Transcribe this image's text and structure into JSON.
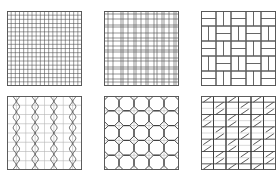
{
  "figure": {
    "title": "",
    "background_color": "#ffffff",
    "line_color": "#3a3a3a",
    "light_line_color": "#b4b4b4",
    "border_color": "#555555",
    "panel_count": 6,
    "layout": "2 rows x 3 columns"
  },
  "panels": [
    {
      "id": "panel-1",
      "name": "uniform-fine-grid",
      "label": "",
      "pattern_type": "square-grid",
      "row": 1,
      "col": 1,
      "x": 7,
      "y": 11,
      "w": 75,
      "h": 75,
      "columns": 18,
      "rows": 18,
      "regular": true,
      "has_diagonals": false,
      "line_color": "#4a4a4a"
    },
    {
      "id": "panel-2",
      "name": "irregular-grid",
      "label": "",
      "pattern_type": "irregular-grid",
      "row": 1,
      "col": 2,
      "x": 104,
      "y": 11,
      "w": 75,
      "h": 75,
      "x_positions": [
        0,
        4,
        9,
        17,
        19,
        24,
        30,
        32,
        37,
        42,
        44,
        50,
        53,
        58,
        60,
        65,
        70,
        72,
        75
      ],
      "y_positions": [
        0,
        3,
        8,
        14,
        16,
        22,
        27,
        30,
        35,
        39,
        41,
        47,
        50,
        56,
        58,
        63,
        68,
        71,
        75
      ],
      "regular": false,
      "has_diagonals": false,
      "line_color": "#4a4a4a"
    },
    {
      "id": "panel-3",
      "name": "basketweave-brick",
      "label": "",
      "pattern_type": "basketweave",
      "row": 1,
      "col": 3,
      "x": 201,
      "y": 11,
      "w": 75,
      "h": 75,
      "unit_cells": 5,
      "bricks_per_unit": 2,
      "regular": true,
      "has_diagonals": false,
      "line_color": "#4a4a4a"
    },
    {
      "id": "panel-4",
      "name": "wavy-vertical-lines",
      "label": "",
      "pattern_type": "sinusoidal-columns",
      "row": 2,
      "col": 1,
      "x": 7,
      "y": 96,
      "w": 75,
      "h": 74,
      "wave_pairs": 4,
      "wave_amplitude": 3.2,
      "wave_periods": 7,
      "horizontal_grid_lines": 8,
      "regular": false,
      "has_diagonals": false,
      "line_color": "#3a3a3a"
    },
    {
      "id": "panel-5",
      "name": "octagon-square-tiling",
      "label": "",
      "pattern_type": "truncated-square-tiling",
      "row": 2,
      "col": 2,
      "x": 104,
      "y": 96,
      "w": 75,
      "h": 74,
      "octagon_columns": 5,
      "octagon_rows": 5,
      "regular": true,
      "has_diagonals": true,
      "line_color": "#3a3a3a"
    },
    {
      "id": "panel-6",
      "name": "pinwheel-h-diagonal",
      "label": "",
      "pattern_type": "h-block-with-diagonal",
      "row": 2,
      "col": 3,
      "x": 201,
      "y": 96,
      "w": 75,
      "h": 74,
      "cell_columns": 6,
      "cell_rows": 6,
      "regular": true,
      "has_diagonals": true,
      "line_color": "#3a3a3a"
    }
  ]
}
